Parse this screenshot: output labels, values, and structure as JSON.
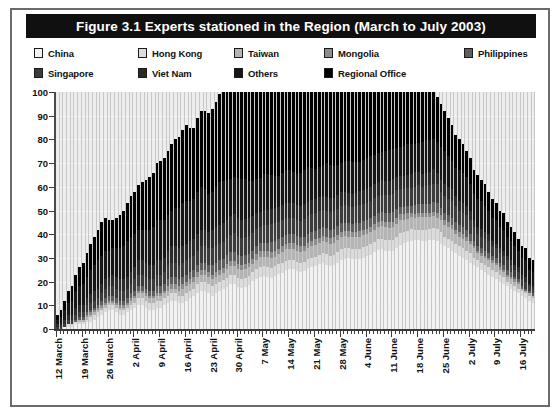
{
  "figure": {
    "title": "Figure 3.1 Experts stationed in the Region (March to July 2003)",
    "frame_color": "#6b6b6b",
    "title_bar_color": "#101010",
    "title_text_color": "#ffffff",
    "plot_background": "#ededed"
  },
  "legend": {
    "position": "top",
    "rows": [
      [
        {
          "label": "China",
          "color": "#f2f2f2"
        },
        {
          "label": "Hong Kong",
          "color": "#dcdcdc"
        },
        {
          "label": "Taiwan",
          "color": "#b4b4b4"
        },
        {
          "label": "Mongolia",
          "color": "#8c8c8c"
        },
        {
          "label": "Philippines",
          "color": "#5e5e5e"
        }
      ],
      [
        {
          "label": "Singapore",
          "color": "#3c3c3c"
        },
        {
          "label": "Viet Nam",
          "color": "#2a2a2a"
        },
        {
          "label": "Others",
          "color": "#161616"
        },
        {
          "label": "Regional Office",
          "color": "#000000"
        }
      ]
    ]
  },
  "chart_data": {
    "type": "bar",
    "title": "Figure 3.1 Experts stationed in the Region (March to July 2003)",
    "xlabel": "",
    "ylabel": "",
    "ylim": [
      0,
      100
    ],
    "yticks": [
      0,
      10,
      20,
      30,
      40,
      50,
      60,
      70,
      80,
      90,
      100
    ],
    "grid": true,
    "stacked": true,
    "legend_position": "top",
    "tick_labels": [
      "12 March",
      "19 March",
      "26 March",
      "2 April",
      "9 April",
      "16 April",
      "23 April",
      "30 April",
      "7 May",
      "14 May",
      "21 May",
      "28 May",
      "4 June",
      "11 June",
      "18 June",
      "25 June",
      "2 July",
      "9 July",
      "16 July"
    ],
    "tick_every_days": 7,
    "x_start": "12 March 2003",
    "x_end": "19 July 2003",
    "n_bars": 130,
    "series": [
      {
        "name": "China",
        "color": "#f2f2f2",
        "values": [
          0,
          0,
          1,
          1,
          1,
          2,
          2,
          2,
          3,
          3,
          4,
          5,
          6,
          7,
          8,
          8,
          7,
          6,
          6,
          7,
          8,
          9,
          10,
          10,
          9,
          8,
          8,
          9,
          9,
          10,
          11,
          12,
          12,
          11,
          11,
          12,
          13,
          14,
          15,
          16,
          16,
          15,
          14,
          15,
          16,
          17,
          18,
          19,
          19,
          18,
          18,
          19,
          20,
          22,
          24,
          26,
          27,
          26,
          26,
          27,
          29,
          30,
          32,
          33,
          33,
          32,
          31,
          32,
          34,
          35,
          36,
          37,
          38,
          37,
          36,
          37,
          38,
          40,
          41,
          42,
          42,
          41,
          40,
          41,
          42,
          43,
          44,
          45,
          45,
          44,
          43,
          42,
          43,
          44,
          45,
          45,
          44,
          43,
          42,
          41,
          40,
          39,
          38,
          37,
          36,
          35,
          34,
          33,
          32,
          31,
          30,
          29,
          28,
          27,
          26,
          25,
          24,
          23,
          22,
          21,
          20,
          19,
          18,
          17,
          16,
          15,
          14,
          13,
          12,
          11
        ]
      },
      {
        "name": "Hong Kong",
        "color": "#dcdcdc",
        "values": [
          0,
          0,
          0,
          1,
          1,
          1,
          1,
          1,
          1,
          2,
          2,
          2,
          2,
          2,
          2,
          2,
          2,
          2,
          2,
          2,
          2,
          2,
          3,
          3,
          3,
          3,
          3,
          3,
          3,
          3,
          3,
          3,
          3,
          3,
          3,
          3,
          3,
          3,
          4,
          4,
          4,
          4,
          4,
          4,
          4,
          4,
          4,
          4,
          4,
          4,
          4,
          4,
          4,
          4,
          5,
          5,
          5,
          5,
          5,
          5,
          5,
          5,
          5,
          5,
          5,
          5,
          5,
          5,
          5,
          5,
          5,
          5,
          6,
          6,
          6,
          6,
          6,
          6,
          6,
          6,
          6,
          6,
          6,
          6,
          6,
          6,
          6,
          6,
          6,
          6,
          6,
          6,
          6,
          6,
          6,
          6,
          6,
          5,
          5,
          5,
          5,
          5,
          5,
          5,
          5,
          4,
          4,
          4,
          4,
          4,
          4,
          4,
          4,
          3,
          3,
          3,
          3,
          3,
          3,
          3,
          3,
          3,
          2,
          2,
          2,
          2,
          2,
          2,
          2,
          2
        ]
      },
      {
        "name": "Taiwan",
        "color": "#b4b4b4",
        "values": [
          0,
          0,
          0,
          0,
          0,
          0,
          1,
          1,
          1,
          1,
          1,
          1,
          1,
          1,
          1,
          1,
          1,
          1,
          1,
          1,
          2,
          2,
          2,
          2,
          2,
          2,
          2,
          2,
          2,
          2,
          2,
          2,
          2,
          2,
          3,
          3,
          3,
          3,
          3,
          3,
          3,
          3,
          3,
          3,
          3,
          3,
          4,
          4,
          4,
          4,
          4,
          4,
          4,
          4,
          4,
          5,
          5,
          5,
          5,
          5,
          5,
          6,
          6,
          6,
          6,
          6,
          6,
          6,
          6,
          7,
          7,
          7,
          7,
          7,
          7,
          7,
          7,
          7,
          7,
          7,
          7,
          7,
          7,
          7,
          7,
          7,
          7,
          7,
          7,
          7,
          7,
          7,
          7,
          7,
          6,
          6,
          6,
          6,
          6,
          6,
          6,
          5,
          5,
          5,
          5,
          5,
          5,
          5,
          4,
          4,
          4,
          4,
          4,
          4,
          3,
          3,
          3,
          3,
          3,
          3,
          2,
          2,
          2,
          2,
          2,
          2,
          1,
          1,
          1,
          1
        ]
      },
      {
        "name": "Mongolia",
        "color": "#8c8c8c",
        "values": [
          0,
          0,
          0,
          0,
          0,
          0,
          0,
          0,
          1,
          1,
          1,
          1,
          1,
          1,
          1,
          1,
          1,
          1,
          1,
          1,
          1,
          1,
          1,
          1,
          1,
          1,
          1,
          1,
          1,
          1,
          2,
          2,
          2,
          2,
          2,
          2,
          2,
          2,
          2,
          2,
          2,
          2,
          2,
          2,
          2,
          2,
          2,
          2,
          2,
          2,
          2,
          2,
          2,
          2,
          3,
          3,
          3,
          3,
          3,
          3,
          3,
          3,
          3,
          3,
          3,
          3,
          3,
          3,
          3,
          3,
          3,
          3,
          3,
          3,
          3,
          3,
          3,
          3,
          3,
          3,
          3,
          3,
          3,
          3,
          3,
          3,
          3,
          3,
          3,
          3,
          3,
          3,
          3,
          3,
          3,
          3,
          2,
          2,
          2,
          2,
          2,
          2,
          2,
          2,
          2,
          2,
          2,
          2,
          2,
          2,
          2,
          2,
          1,
          1,
          1,
          1,
          1,
          1,
          1,
          1,
          1,
          1,
          1,
          1,
          1,
          1
        ]
      },
      {
        "name": "Philippines",
        "color": "#5e5e5e",
        "values": [
          0,
          0,
          0,
          0,
          0,
          1,
          1,
          1,
          1,
          1,
          1,
          1,
          2,
          2,
          2,
          2,
          2,
          2,
          2,
          2,
          2,
          2,
          2,
          2,
          2,
          2,
          2,
          3,
          3,
          3,
          3,
          3,
          3,
          3,
          3,
          3,
          3,
          3,
          3,
          3,
          3,
          3,
          4,
          4,
          4,
          4,
          4,
          4,
          4,
          4,
          4,
          4,
          4,
          4,
          4,
          4,
          4,
          4,
          5,
          5,
          5,
          5,
          5,
          5,
          5,
          5,
          5,
          5,
          5,
          5,
          5,
          5,
          5,
          5,
          5,
          5,
          5,
          5,
          5,
          5,
          5,
          5,
          5,
          5,
          5,
          5,
          5,
          5,
          5,
          5,
          5,
          5,
          5,
          4,
          4,
          4,
          4,
          4,
          4,
          4,
          4,
          4,
          4,
          4,
          3,
          3,
          3,
          3,
          3,
          3,
          3,
          3,
          3,
          2,
          2,
          2,
          2,
          2,
          2,
          2,
          2,
          2,
          2,
          2,
          1,
          1,
          1,
          1,
          1,
          1
        ]
      },
      {
        "name": "Singapore",
        "color": "#3c3c3c",
        "values": [
          1,
          1,
          1,
          2,
          2,
          2,
          2,
          2,
          3,
          3,
          3,
          3,
          3,
          4,
          4,
          4,
          4,
          4,
          4,
          4,
          4,
          5,
          5,
          5,
          5,
          5,
          5,
          5,
          5,
          5,
          6,
          6,
          6,
          6,
          6,
          6,
          6,
          6,
          6,
          7,
          7,
          7,
          7,
          7,
          7,
          7,
          7,
          7,
          8,
          8,
          8,
          8,
          8,
          8,
          8,
          8,
          9,
          9,
          9,
          9,
          9,
          9,
          9,
          9,
          9,
          9,
          9,
          10,
          10,
          10,
          10,
          10,
          10,
          10,
          10,
          10,
          10,
          10,
          10,
          10,
          10,
          10,
          10,
          10,
          10,
          10,
          10,
          10,
          10,
          10,
          10,
          10,
          10,
          9,
          9,
          9,
          9,
          9,
          9,
          8,
          8,
          8,
          8,
          8,
          7,
          7,
          7,
          7,
          7,
          6,
          6,
          6,
          6,
          6,
          5,
          5,
          5,
          5,
          4,
          4,
          4,
          4,
          4,
          3,
          3,
          3,
          3,
          3,
          2,
          2
        ]
      },
      {
        "name": "Viet Nam",
        "color": "#2a2a2a",
        "values": [
          1,
          1,
          2,
          2,
          2,
          3,
          3,
          3,
          3,
          4,
          4,
          4,
          4,
          4,
          4,
          5,
          5,
          5,
          5,
          5,
          5,
          5,
          6,
          6,
          6,
          6,
          6,
          6,
          6,
          6,
          6,
          7,
          7,
          7,
          7,
          7,
          7,
          7,
          7,
          7,
          7,
          7,
          8,
          8,
          8,
          8,
          8,
          8,
          8,
          8,
          8,
          8,
          8,
          8,
          8,
          8,
          8,
          8,
          8,
          8,
          8,
          8,
          8,
          8,
          8,
          8,
          8,
          8,
          8,
          8,
          8,
          8,
          8,
          8,
          8,
          8,
          8,
          8,
          8,
          8,
          8,
          8,
          8,
          8,
          8,
          8,
          8,
          8,
          8,
          8,
          8,
          8,
          7,
          7,
          7,
          7,
          7,
          7,
          6,
          6,
          6,
          6,
          6,
          5,
          5,
          5,
          5,
          5,
          4,
          4,
          4,
          4,
          4,
          3,
          3,
          3,
          3,
          3,
          2,
          2,
          2,
          2,
          2,
          2,
          2,
          2,
          2,
          2,
          1,
          1
        ]
      },
      {
        "name": "Others",
        "color": "#161616",
        "values": [
          2,
          3,
          4,
          5,
          6,
          7,
          8,
          9,
          9,
          10,
          11,
          12,
          12,
          12,
          11,
          11,
          12,
          13,
          14,
          15,
          15,
          14,
          13,
          13,
          14,
          15,
          16,
          17,
          17,
          16,
          15,
          15,
          16,
          17,
          18,
          18,
          17,
          17,
          18,
          18,
          17,
          16,
          16,
          17,
          18,
          18,
          17,
          16,
          16,
          17,
          18,
          18,
          17,
          16,
          16,
          17,
          18,
          18,
          17,
          16,
          16,
          17,
          18,
          18,
          17,
          17,
          18,
          19,
          19,
          18,
          17,
          17,
          18,
          19,
          19,
          18,
          17,
          17,
          18,
          19,
          19,
          18,
          17,
          17,
          18,
          18,
          17,
          16,
          16,
          17,
          17,
          16,
          15,
          15,
          16,
          16,
          15,
          14,
          14,
          15,
          15,
          14,
          13,
          13,
          14,
          14,
          13,
          12,
          12,
          13,
          13,
          12,
          11,
          11,
          12,
          12,
          11,
          10,
          10,
          10,
          9,
          9,
          8,
          8,
          8,
          7,
          7,
          7,
          6,
          6
        ]
      },
      {
        "name": "Regional Office",
        "color": "#000000",
        "values": [
          2,
          3,
          4,
          5,
          6,
          7,
          8,
          9,
          10,
          11,
          12,
          13,
          14,
          14,
          13,
          12,
          13,
          14,
          15,
          16,
          17,
          18,
          19,
          20,
          21,
          22,
          23,
          24,
          25,
          26,
          27,
          28,
          29,
          30,
          31,
          32,
          31,
          30,
          31,
          32,
          33,
          34,
          35,
          36,
          37,
          38,
          38,
          37,
          36,
          37,
          38,
          39,
          40,
          41,
          42,
          43,
          42,
          41,
          42,
          43,
          44,
          43,
          42,
          43,
          44,
          45,
          44,
          43,
          42,
          43,
          44,
          43,
          42,
          41,
          42,
          43,
          42,
          41,
          40,
          41,
          42,
          41,
          40,
          39,
          38,
          37,
          36,
          35,
          34,
          33,
          32,
          31,
          30,
          29,
          28,
          27,
          26,
          25,
          24,
          23,
          22,
          21,
          20,
          19,
          18,
          17,
          16,
          15,
          14,
          13,
          12,
          11,
          11,
          10,
          10,
          9,
          9,
          8,
          8,
          7,
          7,
          7,
          6,
          6,
          6,
          5,
          5,
          5,
          5,
          5
        ]
      }
    ]
  }
}
